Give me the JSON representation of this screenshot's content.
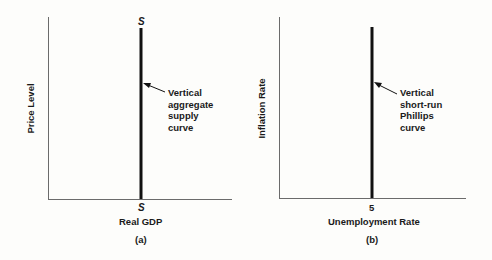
{
  "panels": [
    {
      "id": "a",
      "caption": "(a)",
      "ylabel": "Price Level",
      "xlabel": "Real GDP",
      "curve_top_label": "S",
      "curve_bottom_label": "S",
      "annotation": [
        "Vertical",
        "aggregate",
        "supply",
        "curve"
      ]
    },
    {
      "id": "b",
      "caption": "(b)",
      "ylabel": "Inflation Rate",
      "xlabel": "Unemployment Rate",
      "x_tick": "5",
      "annotation": [
        "Vertical",
        "short-run",
        "Phillips",
        "curve"
      ]
    }
  ],
  "colors": {
    "axis": "#6b6b6b",
    "curve": "#111111",
    "background": "#fdfdfb"
  }
}
